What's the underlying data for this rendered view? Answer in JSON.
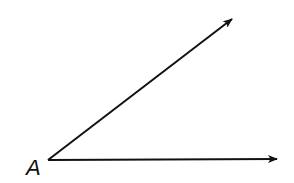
{
  "diagram": {
    "type": "angle",
    "vertex": {
      "label": "A",
      "x": 48,
      "y": 160
    },
    "rays": [
      {
        "name": "upper-ray",
        "from": [
          48,
          160
        ],
        "to": [
          233,
          18
        ]
      },
      {
        "name": "horizontal-ray",
        "from": [
          48,
          160
        ],
        "to": [
          278,
          159
        ]
      }
    ],
    "stroke_color": "#111111",
    "background": "#ffffff"
  }
}
